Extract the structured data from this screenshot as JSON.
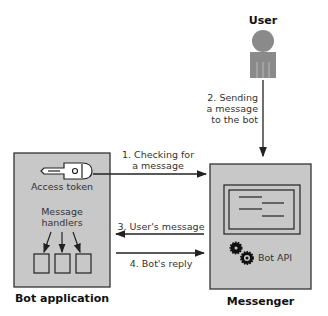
{
  "actors": {
    "user": {
      "label": "User"
    },
    "bot_application": {
      "label": "Bot application",
      "access_token_label": "Access token",
      "handlers_label_line1": "Message",
      "handlers_label_line2": "handlers",
      "handler_count": 3
    },
    "messenger": {
      "label": "Messenger",
      "bot_api_label": "Bot API"
    }
  },
  "steps": [
    {
      "line1": "1. Checking for",
      "line2": "a message"
    },
    {
      "line1": "2. Sending",
      "line2": "a message",
      "line3": "to the bot"
    },
    {
      "line1": "3. User's message"
    },
    {
      "line1": "4. Bot's reply"
    }
  ],
  "colors": {
    "box_fill": "#c8c8c8",
    "stroke": "#222222",
    "user_fill": "#8a8a8a"
  }
}
